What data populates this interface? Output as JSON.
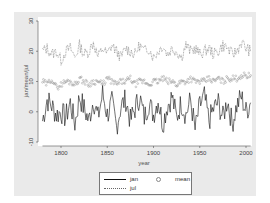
{
  "chart_data": {
    "type": "line",
    "title": "",
    "xlabel": "year",
    "ylabel": "jan/mean/jul",
    "xlim": [
      1775,
      2008
    ],
    "ylim": [
      -10,
      30
    ],
    "xticks": [
      1800,
      1850,
      1900,
      1950,
      2000
    ],
    "yticks": [
      -10,
      0,
      10,
      20,
      30
    ],
    "grid": false,
    "legend_position": "bottom",
    "x": [
      1780,
      1785,
      1790,
      1795,
      1800,
      1805,
      1810,
      1815,
      1820,
      1825,
      1830,
      1835,
      1840,
      1845,
      1850,
      1855,
      1860,
      1865,
      1870,
      1875,
      1880,
      1885,
      1890,
      1895,
      1900,
      1905,
      1910,
      1915,
      1920,
      1925,
      1930,
      1935,
      1940,
      1945,
      1950,
      1955,
      1960,
      1965,
      1970,
      1975,
      1980,
      1985,
      1990,
      1995,
      2000,
      2005
    ],
    "series": [
      {
        "name": "jan",
        "style": "solid",
        "color": "#111111",
        "values": [
          -3,
          4,
          2,
          -1,
          0,
          -2,
          3,
          -4,
          5,
          1,
          -3,
          4,
          -2,
          6,
          -1,
          3,
          -5,
          2,
          4,
          -3,
          1,
          5,
          -2,
          3,
          -1,
          4,
          -4,
          2,
          5,
          -2,
          3,
          -1,
          4,
          -6,
          2,
          5,
          -3,
          1,
          3,
          -2,
          4,
          -4,
          2,
          5,
          0,
          3
        ]
      },
      {
        "name": "mean",
        "style": "circle-markers",
        "color": "#888888",
        "values": [
          10,
          9,
          11,
          8,
          9,
          10,
          10,
          9,
          11,
          10,
          9,
          10,
          10,
          9,
          11,
          10,
          9,
          10,
          10,
          11,
          9,
          10,
          10,
          9,
          10,
          10,
          11,
          10,
          10,
          9,
          10,
          10,
          11,
          10,
          10,
          10,
          11,
          10,
          11,
          10,
          11,
          11,
          11,
          12,
          12,
          12
        ]
      },
      {
        "name": "jul",
        "style": "dotted",
        "color": "#666666",
        "values": [
          20,
          21,
          19,
          20,
          17,
          20,
          21,
          18,
          22,
          19,
          20,
          23,
          18,
          21,
          19,
          22,
          20,
          18,
          21,
          20,
          19,
          22,
          20,
          21,
          18,
          20,
          22,
          19,
          21,
          20,
          18,
          22,
          20,
          21,
          19,
          20,
          21,
          19,
          20,
          22,
          21,
          19,
          20,
          23,
          21,
          20
        ]
      }
    ]
  },
  "legend": {
    "items": [
      {
        "label": "jan"
      },
      {
        "label": "mean"
      },
      {
        "label": "jul"
      }
    ]
  }
}
